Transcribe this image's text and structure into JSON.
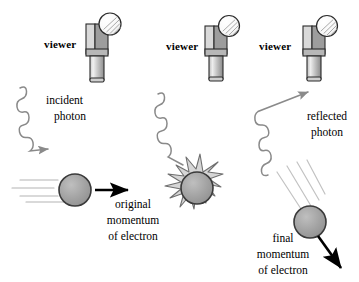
{
  "figure": {
    "background_color": "#ffffff",
    "ink_color": "#000000",
    "sphere_fill": "#9e9e9e",
    "sphere_stroke": "#333333",
    "wave_color": "#8a8a8a",
    "speedline_color": "#b0b0b0",
    "viewer_body_light": "#d8d8d8",
    "viewer_body_mid": "#bdbdbd",
    "viewer_body_dark": "#9a9a9a"
  },
  "panels": [
    {
      "id": "before",
      "viewer_label": "viewer",
      "photon_label_line1": "incident",
      "photon_label_line2": "photon",
      "momentum_label_line1": "original",
      "momentum_label_line2": "momentum",
      "momentum_label_line3": "of electron",
      "photon_direction": "down-right",
      "momentum_direction": "right"
    },
    {
      "id": "collision",
      "viewer_label": "viewer",
      "photon_label_line1": "",
      "photon_label_line2": "",
      "momentum_label_line1": "",
      "momentum_label_line2": "",
      "momentum_label_line3": "",
      "photon_direction": "down-right",
      "momentum_direction": "none"
    },
    {
      "id": "after",
      "viewer_label": "viewer",
      "photon_label_line1": "reflected",
      "photon_label_line2": "photon",
      "momentum_label_line1": "final",
      "momentum_label_line2": "momentum",
      "momentum_label_line3": "of electron",
      "photon_direction": "up-right",
      "momentum_direction": "down-right"
    }
  ],
  "labels": {
    "viewer_1": "viewer",
    "viewer_2": "viewer",
    "viewer_3": "viewer",
    "incident_photon": "incident\nphoton",
    "reflected_photon": "reflected\nphoton",
    "original_momentum": "original\nmomentum\nof electron",
    "final_momentum": "final\nmomentum\nof electron"
  }
}
